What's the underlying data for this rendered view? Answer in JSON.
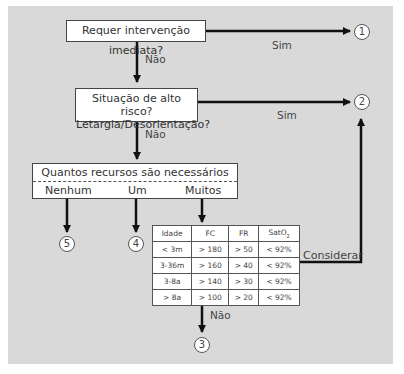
{
  "diagram": {
    "q1": {
      "text": "Requer intervenção imediata?",
      "yes": "Sim",
      "no": "Não",
      "yes_target": "1"
    },
    "q2": {
      "line1": "Situação de alto risco?",
      "line2": "Letargia/Desorientação?",
      "yes": "Sim",
      "no": "Não",
      "yes_target": "2"
    },
    "q3": {
      "text": "Quantos recursos são necessários",
      "options": [
        {
          "label": "Nenhum",
          "target": "5"
        },
        {
          "label": "Um",
          "target": "4"
        },
        {
          "label": "Muitos",
          "target": "table"
        }
      ]
    },
    "table": {
      "headers": [
        "Idade",
        "FC",
        "FR",
        "SatO",
        "2"
      ],
      "rows": [
        [
          "< 3m",
          "> 180",
          "> 50",
          "< 92%"
        ],
        [
          "3-36m",
          "> 160",
          "> 40",
          "< 92%"
        ],
        [
          "3-8a",
          "> 140",
          "> 30",
          "< 92%"
        ],
        [
          "> 8a",
          "> 100",
          "> 20",
          "< 92%"
        ]
      ],
      "consider_label": "Considerar",
      "consider_target": "2",
      "no": "Não",
      "no_target": "3"
    },
    "circles": [
      "1",
      "2",
      "3",
      "4",
      "5"
    ]
  }
}
